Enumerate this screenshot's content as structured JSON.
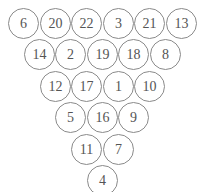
{
  "diagram": {
    "type": "number-triangle",
    "rows": [
      [
        6,
        20,
        22,
        3,
        21,
        13
      ],
      [
        14,
        2,
        19,
        18,
        8
      ],
      [
        12,
        17,
        1,
        10
      ],
      [
        5,
        16,
        9
      ],
      [
        11,
        7
      ],
      [
        4
      ]
    ],
    "cells": {
      "r0c0": "6",
      "r0c1": "20",
      "r0c2": "22",
      "r0c3": "3",
      "r0c4": "21",
      "r0c5": "13",
      "r1c0": "14",
      "r1c1": "2",
      "r1c2": "19",
      "r1c3": "18",
      "r1c4": "8",
      "r2c0": "12",
      "r2c1": "17",
      "r2c2": "1",
      "r2c3": "10",
      "r3c0": "5",
      "r3c1": "16",
      "r3c2": "9",
      "r4c0": "11",
      "r4c1": "7",
      "r5c0": "4"
    },
    "colors": {
      "circle_border": "#8a8a8a",
      "text": "#555555",
      "background": "#ffffff"
    }
  }
}
